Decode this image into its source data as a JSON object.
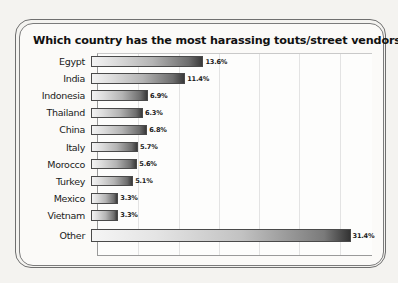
{
  "chart_data": {
    "type": "bar",
    "orientation": "horizontal",
    "title": "Which country has the most harassing touts/street vendors?",
    "xlabel": "",
    "ylabel": "",
    "xlim": [
      0,
      34
    ],
    "grid": true,
    "legend": false,
    "categories": [
      "Egypt",
      "India",
      "Indonesia",
      "Thailand",
      "China",
      "Italy",
      "Morocco",
      "Turkey",
      "Mexico",
      "Vietnam",
      "Other"
    ],
    "values": [
      13.6,
      11.4,
      6.9,
      6.3,
      6.8,
      5.7,
      5.6,
      5.1,
      3.3,
      3.3,
      31.4
    ],
    "value_labels": [
      "13.6%",
      "11.4%",
      "6.9%",
      "6.3%",
      "6.8%",
      "5.7%",
      "5.6%",
      "5.1%",
      "3.3%",
      "3.3%",
      "31.4%"
    ],
    "bars": [
      {
        "category": "Egypt",
        "value": 13.6,
        "label": "13.6%"
      },
      {
        "category": "India",
        "value": 11.4,
        "label": "11.4%"
      },
      {
        "category": "Indonesia",
        "value": 6.9,
        "label": "6.9%"
      },
      {
        "category": "Thailand",
        "value": 6.3,
        "label": "6.3%"
      },
      {
        "category": "China",
        "value": 6.8,
        "label": "6.8%"
      },
      {
        "category": "Italy",
        "value": 5.7,
        "label": "5.7%"
      },
      {
        "category": "Morocco",
        "value": 5.6,
        "label": "5.6%"
      },
      {
        "category": "Turkey",
        "value": 5.1,
        "label": "5.1%"
      },
      {
        "category": "Mexico",
        "value": 3.3,
        "label": "3.3%"
      },
      {
        "category": "Vietnam",
        "value": 3.3,
        "label": "3.3%"
      },
      {
        "category": "Other",
        "value": 31.4,
        "label": "31.4%"
      }
    ],
    "gridline_values": [
      5,
      10,
      15,
      20,
      25,
      30
    ],
    "colors": {
      "bar_gradient_start": "#f3f3f3",
      "bar_gradient_end": "#3a3a3a",
      "bar_outline": "#4a4a4a",
      "plot_background": "#fdfdfc",
      "gridline": "#e3e3e3",
      "axis": "#9a9a9a",
      "page_background": "#f4f3f0",
      "frame_border": "#6f6f6f",
      "title_text": "#111111",
      "label_text": "#1a1a1a"
    }
  }
}
